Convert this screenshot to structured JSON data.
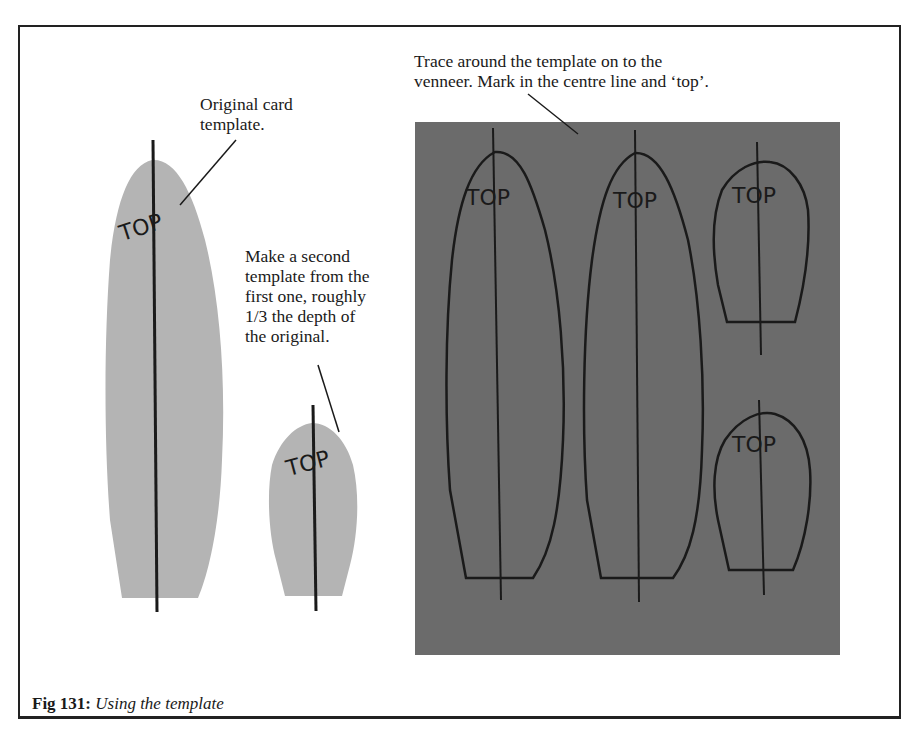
{
  "figure": {
    "number_label": "Fig 131:",
    "title": "Using the template"
  },
  "annotations": {
    "original": "Original card\ntemplate.",
    "second": "Make a second\ntemplate from the\nfirst one, roughly\n1/3 the depth of\nthe original.",
    "trace": "Trace around the template on to the\nvenneer. Mark in the centre line and ‘top’."
  },
  "templates": {
    "card_large_mark": "TOP",
    "card_small_mark": "TOP"
  },
  "veneer": {
    "marks": [
      "TOP",
      "TOP",
      "TOP",
      "TOP"
    ]
  },
  "colors": {
    "card": "#b4b4b4",
    "veneer": "#6b6b6b",
    "ink": "#1a1a1a"
  }
}
